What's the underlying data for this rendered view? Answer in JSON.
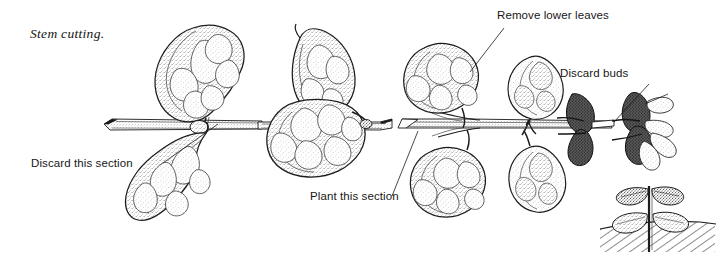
{
  "figure": {
    "title": "Stem cutting.",
    "background_color": "#ffffff",
    "ink_color": "#171717",
    "media": "stippled pen-and-ink botanical illustration",
    "width": 722,
    "height": 264
  },
  "labels": [
    {
      "id": "title",
      "text": "Stem cutting.",
      "style": "serif-italic",
      "x": 30,
      "y": 38
    },
    {
      "id": "discard-this-section",
      "text": "Discard this section",
      "style": "sans",
      "x": 31,
      "y": 167,
      "leader_to": "left stem end"
    },
    {
      "id": "plant-this-section",
      "text": "Plant this section",
      "style": "sans",
      "x": 310,
      "y": 200,
      "leader_to": "middle stem segment"
    },
    {
      "id": "remove-lower-leaves",
      "text": "Remove lower leaves",
      "style": "sans",
      "x": 497,
      "y": 19,
      "leader_to": "upper leaf of right cutting"
    },
    {
      "id": "discard-buds",
      "text": "Discard buds",
      "style": "sans",
      "x": 560,
      "y": 77,
      "leader_to": "bud cluster on stem"
    }
  ],
  "elements": {
    "stem_label": "horizontal woody stem",
    "leaf_label": "stippled lobed leaf",
    "bud_label": "dark flower bud cluster",
    "cut_label": "angled stem cut",
    "soil_label": "hatched soil line",
    "rooted_cutting_label": "rooted cutting planted in soil"
  }
}
